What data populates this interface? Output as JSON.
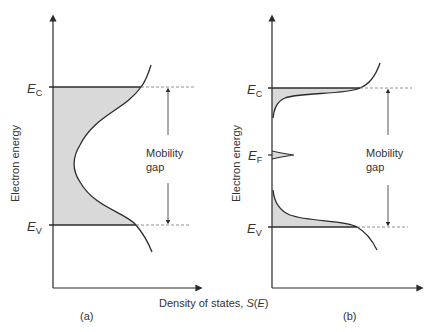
{
  "figure": {
    "x_axis_label": "Density of states, ",
    "x_axis_symbol": "S",
    "x_axis_arg": "E",
    "panels": [
      {
        "id": "a",
        "caption": "(a)",
        "y_axis_label": "Electron energy",
        "levels": [
          {
            "name": "E_C",
            "base": "E",
            "sub": "C"
          },
          {
            "name": "E_V",
            "base": "E",
            "sub": "V"
          }
        ],
        "gap_label_line1": "Mobility",
        "gap_label_line2": "gap"
      },
      {
        "id": "b",
        "caption": "(b)",
        "y_axis_label": "Electron energy",
        "levels": [
          {
            "name": "E_C",
            "base": "E",
            "sub": "C"
          },
          {
            "name": "E_F",
            "base": "E",
            "sub": "F"
          },
          {
            "name": "E_V",
            "base": "E",
            "sub": "V"
          }
        ],
        "gap_label_line1": "Mobility",
        "gap_label_line2": "gap"
      }
    ],
    "colors": {
      "line": "#2b2b2b",
      "fill": "#d9d9d9",
      "dash": "#777777"
    }
  }
}
